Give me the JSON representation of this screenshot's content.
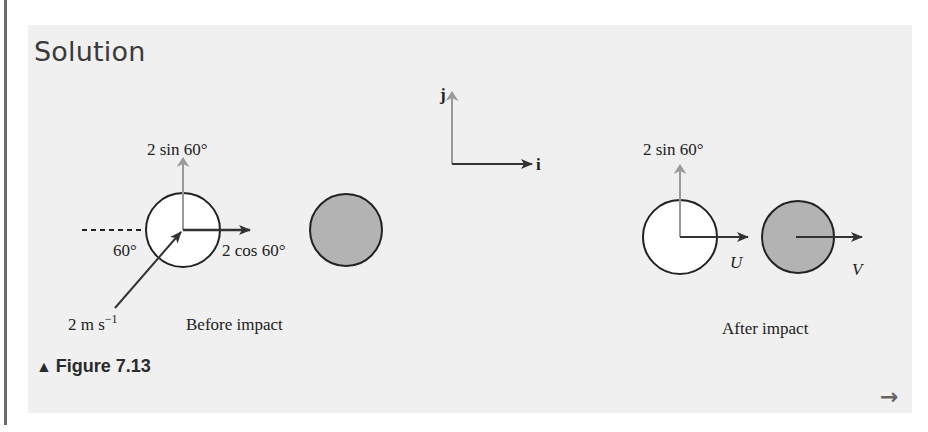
{
  "section": {
    "title": "Solution"
  },
  "figure": {
    "caption_marker": "▲",
    "caption": "Figure 7.13",
    "axes": {
      "i_label": "i",
      "j_label": "j"
    },
    "before": {
      "label": "Before impact",
      "vertical_component": "2 sin 60°",
      "horizontal_component": "2 cos 60°",
      "angle": "60°",
      "speed": "2 m s",
      "speed_exp": "−1"
    },
    "after": {
      "label": "After impact",
      "vertical_component": "2 sin 60°",
      "u_label": "U",
      "v_label": "V"
    },
    "colors": {
      "panel": "#f0f0f0",
      "shaded_ball": "#b3b3b3",
      "gray_arrow": "#9a9a9a",
      "dark_arrow": "#333333"
    }
  },
  "nav": {
    "next_icon": "→"
  }
}
